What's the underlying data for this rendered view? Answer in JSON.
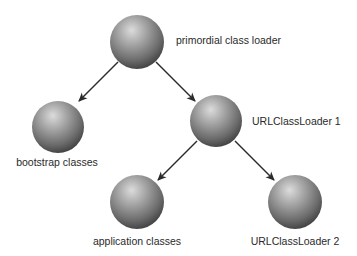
{
  "diagram": {
    "type": "tree",
    "colors": {
      "background": "#ffffff",
      "sphere_light": "#d8d8d8",
      "sphere_mid": "#8a8a8a",
      "sphere_dark": "#3a3a3a",
      "arrow": "#2b2b2b",
      "text": "#2a2a2a"
    },
    "nodes": [
      {
        "id": "primordial",
        "label": "primordial class loader",
        "icon": "sphere-icon"
      },
      {
        "id": "bootstrap",
        "label": "bootstrap classes",
        "icon": "sphere-icon"
      },
      {
        "id": "url1",
        "label": "URLClassLoader 1",
        "icon": "sphere-icon"
      },
      {
        "id": "application",
        "label": "application classes",
        "icon": "sphere-icon"
      },
      {
        "id": "url2",
        "label": "URLClassLoader 2",
        "icon": "sphere-icon"
      }
    ],
    "edges": [
      {
        "from": "primordial",
        "to": "bootstrap"
      },
      {
        "from": "primordial",
        "to": "url1"
      },
      {
        "from": "url1",
        "to": "application"
      },
      {
        "from": "url1",
        "to": "url2"
      }
    ]
  }
}
